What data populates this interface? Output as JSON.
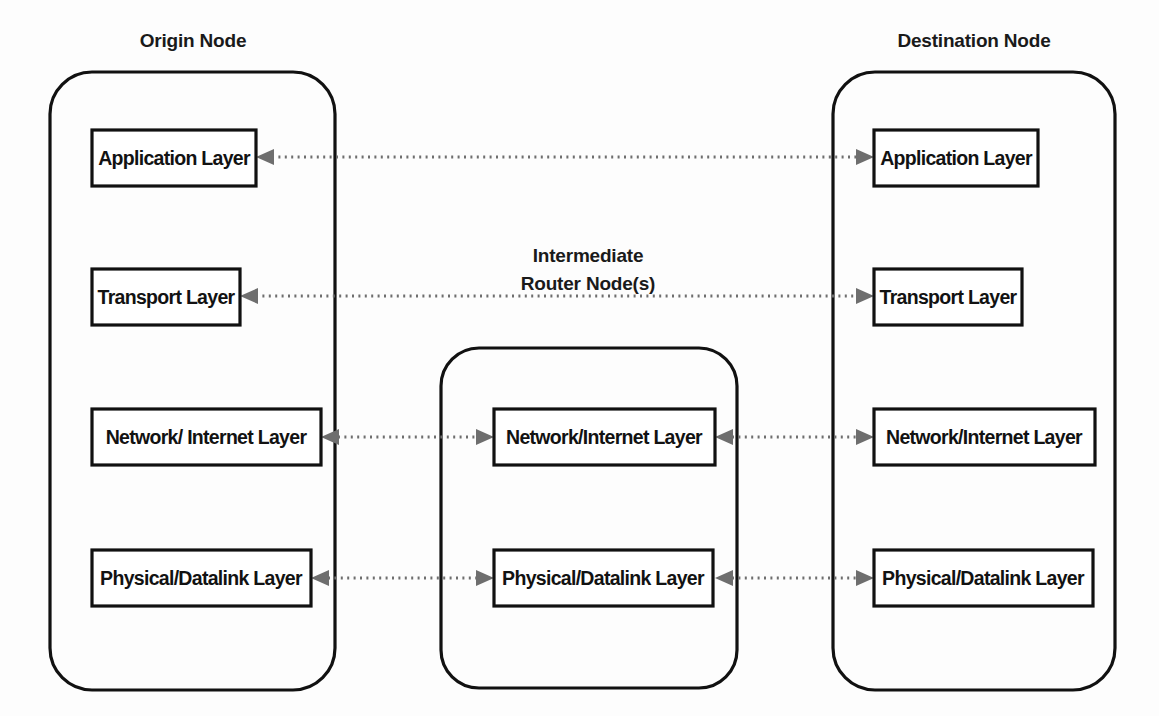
{
  "diagram": {
    "background_color": "#fdfdfd",
    "stroke_color": "#111111",
    "connector_color": "#6e6e6e",
    "nodes": [
      {
        "id": "origin",
        "title": "Origin Node",
        "title_lines": [
          "Origin Node"
        ],
        "layers": [
          {
            "id": "origin-application",
            "label": "Application Layer"
          },
          {
            "id": "origin-transport",
            "label": "Transport Layer"
          },
          {
            "id": "origin-network",
            "label": "Network/ Internet Layer"
          },
          {
            "id": "origin-physical",
            "label": "Physical/Datalink Layer"
          }
        ]
      },
      {
        "id": "router",
        "title": "Intermediate Router Node(s)",
        "title_lines": [
          "Intermediate",
          "Router Node(s)"
        ],
        "layers": [
          {
            "id": "router-network",
            "label": "Network/Internet Layer"
          },
          {
            "id": "router-physical",
            "label": "Physical/Datalink Layer"
          }
        ]
      },
      {
        "id": "destination",
        "title": "Destination Node",
        "title_lines": [
          "Destination Node"
        ],
        "layers": [
          {
            "id": "destination-application",
            "label": "Application Layer"
          },
          {
            "id": "destination-transport",
            "label": "Transport Layer"
          },
          {
            "id": "destination-network",
            "label": "Network/Internet Layer"
          },
          {
            "id": "destination-physical",
            "label": "Physical/Datalink Layer"
          }
        ]
      }
    ],
    "connections": [
      {
        "id": "conn-application",
        "from": "origin-application",
        "to": "destination-application",
        "style": "dotted",
        "direction": "bidirectional"
      },
      {
        "id": "conn-transport",
        "from": "origin-transport",
        "to": "destination-transport",
        "style": "dotted",
        "direction": "bidirectional"
      },
      {
        "id": "conn-network-left",
        "from": "origin-network",
        "to": "router-network",
        "style": "dotted",
        "direction": "bidirectional"
      },
      {
        "id": "conn-network-right",
        "from": "router-network",
        "to": "destination-network",
        "style": "dotted",
        "direction": "bidirectional"
      },
      {
        "id": "conn-physical-left",
        "from": "origin-physical",
        "to": "router-physical",
        "style": "dotted",
        "direction": "bidirectional"
      },
      {
        "id": "conn-physical-right",
        "from": "router-physical",
        "to": "destination-physical",
        "style": "dotted",
        "direction": "bidirectional"
      }
    ]
  }
}
